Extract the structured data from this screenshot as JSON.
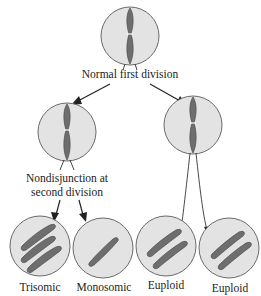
{
  "diagram": {
    "labels": {
      "first_division": "Normal first division",
      "nondisjunction_line1": "Nondisjunction at",
      "nondisjunction_line2": "second division"
    },
    "daughter_cells": [
      {
        "label": "Trisomic",
        "chromosome_count": 3
      },
      {
        "label": "Monosomic",
        "chromosome_count": 1
      },
      {
        "label": "Euploid",
        "chromosome_count": 2
      },
      {
        "label": "Euploid",
        "chromosome_count": 2
      }
    ],
    "colors": {
      "cell_fill": "#e3e3e3",
      "cell_outline": "#6a6a6a",
      "chromosome": "#6e6e6e",
      "arrow": "#222222"
    }
  }
}
